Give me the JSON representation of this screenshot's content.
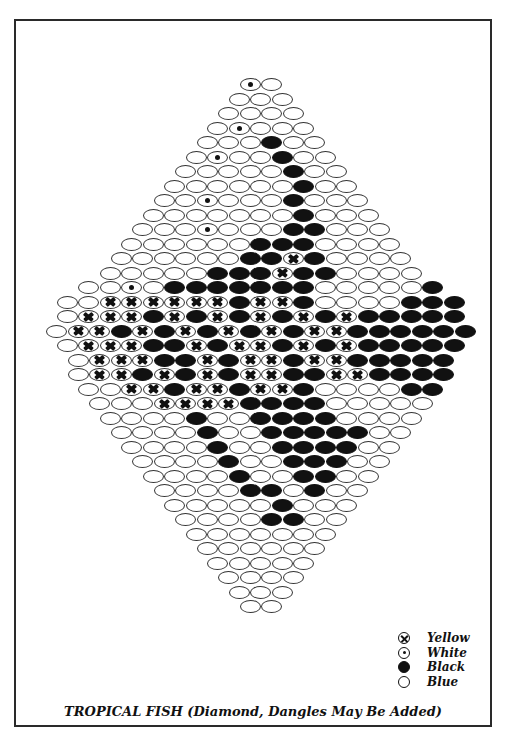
{
  "title": "TROPICAL FISH (Diamond, Dangles May Be Added)",
  "colors": {
    "ink": "#111111",
    "paper": "#ffffff"
  },
  "legend": [
    {
      "code": "Y",
      "symbol": "circle-x",
      "label": "Yellow"
    },
    {
      "code": "W",
      "symbol": "circle-dot",
      "label": "White"
    },
    {
      "code": "K",
      "symbol": "filled-circle",
      "label": "Black"
    },
    {
      "code": "B",
      "symbol": "open-circle",
      "label": "Blue"
    }
  ],
  "pattern": {
    "type": "brick-stitch diamond",
    "center_x": 261,
    "top_y": 78,
    "bead_width": 21.5,
    "row_pitch": 14.5,
    "rows": [
      "WB",
      "BBB",
      "BBBB",
      "BWBBB",
      "BBBKBB",
      "BWBBKBB",
      "BBBBBKBB",
      "BBBBBBKBB",
      "BBWBBBKBBB",
      "BBBBBBBKBBB",
      "BBBWBBBKKBBB",
      "BBBBBBKKKBBBB",
      "BBBBBBKKYKBBBB",
      "BBBBBKKKYKKBBBB",
      "BBWBKKKKKKKBBBBBK",
      "BBYYYYYYKYYKBBBBKKK",
      "BYYYKYKYKYKYKYKKKKK",
      "BYYKYKYKYKYKYYKKKKKK",
      "BYYYKKYKYYKYKYKKKKK",
      "BYYYKKYKYYKYYKKKKK",
      "BYYKYKYKYYKKYYKKKK",
      "BBYYKYYKYYKBBBBKK",
      "BBBYYYYKKKKBBBBB",
      "BBBBKBBKKKKBBBB",
      "BBBBKBBKKKKKBB",
      "BBBBKBBKKKKBB",
      "BBBBKBBKKKBB",
      "BBBBKBBKKBB",
      "BBBBKKBKBB",
      "BBBBBKBBB",
      "BBBBKKBB",
      "BBBBBBB",
      "BBBBBB",
      "BBBBB",
      "BBBB",
      "BBB",
      "BB"
    ]
  }
}
